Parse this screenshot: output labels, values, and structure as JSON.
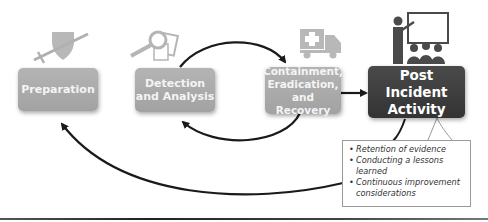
{
  "diagram": {
    "type": "incident-response-lifecycle",
    "phases": [
      {
        "id": "preparation",
        "label": "Preparation",
        "icon": "shield-sword-icon",
        "style": "light"
      },
      {
        "id": "detection",
        "label_line1": "Detection",
        "label_line2": "and Analysis",
        "icon": "magnifier-document-icon",
        "style": "light"
      },
      {
        "id": "containment",
        "label_line1": "Containment,",
        "label_line2": "Eradication,",
        "label_line3": "and Recovery",
        "icon": "ambulance-truck-icon",
        "style": "light"
      },
      {
        "id": "post_incident",
        "label_line1": "Post Incident",
        "label_line2": "Activity",
        "icon": "presenter-audience-icon",
        "style": "dark"
      }
    ],
    "callout": {
      "items": [
        "Retention of evidence",
        "Conducting a lessons learned",
        "Continuous improvement considerations"
      ]
    },
    "edges": [
      {
        "from": "detection",
        "to": "containment",
        "shape": "arc-over"
      },
      {
        "from": "containment",
        "to": "detection",
        "shape": "arc-under"
      },
      {
        "from": "containment",
        "to": "post_incident",
        "shape": "straight"
      },
      {
        "from": "post_incident",
        "to": "preparation",
        "shape": "arc-under"
      }
    ],
    "colors": {
      "light_box": "#a9a9a9",
      "dark_box": "#3c3c3c",
      "icon_gray": "#b5b5b5",
      "icon_dark": "#4a4a4a",
      "arrow": "#1a1a1a"
    }
  }
}
